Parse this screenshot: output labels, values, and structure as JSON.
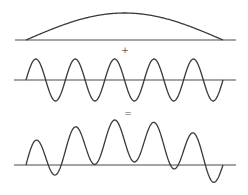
{
  "diagram": {
    "title": "",
    "stroke_color": "#3a3a3a",
    "axis_color": "#4a4a4a",
    "background": "#ffffff",
    "operators": {
      "plus": {
        "symbol": "+",
        "x": 125,
        "y": 50
      },
      "equals": {
        "symbol": "=",
        "x": 128,
        "y": 113
      }
    },
    "panels": [
      {
        "name": "envelope-wave",
        "baseline_y": 40,
        "axis_x": [
          15,
          236
        ],
        "wave_x": [
          26,
          223
        ],
        "type": "half-sine",
        "amplitude": 27,
        "cycles": 0.5
      },
      {
        "name": "carrier-wave",
        "baseline_y": 80,
        "axis_x": [
          14,
          236
        ],
        "wave_x": [
          26,
          223
        ],
        "type": "sine",
        "amplitude": 21,
        "cycles": 5
      },
      {
        "name": "sum-wave",
        "baseline_y": 165,
        "axis_x": [
          14,
          236
        ],
        "wave_x": [
          26,
          223
        ],
        "type": "sum",
        "amplitude": 21,
        "envelope_amplitude": 27,
        "cycles": 5
      }
    ]
  }
}
